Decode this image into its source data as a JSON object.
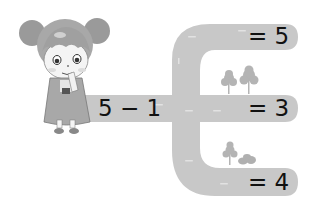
{
  "illustration": {
    "character": "girl-with-pigtails",
    "road_color": "#c8c8c8",
    "tree_color": "#b4b4b4"
  },
  "expression": {
    "start": "5 − 1",
    "branches": [
      {
        "label": "= 5"
      },
      {
        "label": "= 3"
      },
      {
        "label": "= 4"
      }
    ]
  }
}
